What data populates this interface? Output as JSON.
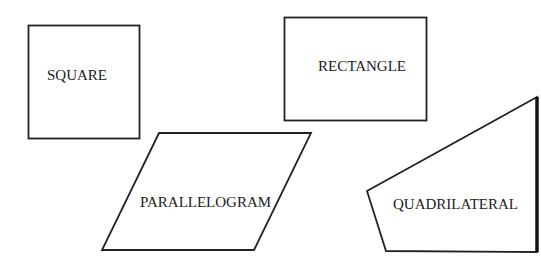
{
  "diagram": {
    "shapes": [
      {
        "id": "square",
        "label": "SQUARE"
      },
      {
        "id": "rectangle",
        "label": "RECTANGLE"
      },
      {
        "id": "parallelogram",
        "label": "PARALLELOGRAM"
      },
      {
        "id": "quadrilateral",
        "label": "QUADRILATERAL"
      }
    ]
  },
  "colors": {
    "stroke": "#222222",
    "background": "#ffffff"
  }
}
